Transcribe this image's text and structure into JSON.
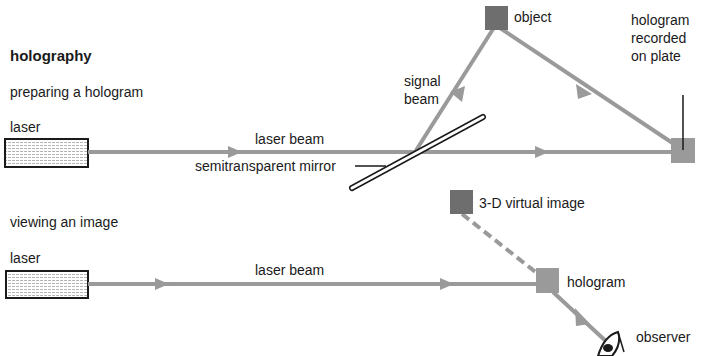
{
  "title": "holography",
  "sections": {
    "preparing": {
      "heading": "preparing a hologram",
      "laser_label": "laser",
      "beam_label": "laser beam",
      "mirror_label": "semitransparent mirror",
      "signal_beam_label": "signal\nbeam",
      "object_label": "object",
      "plate_label": "hologram\nrecorded\non plate"
    },
    "viewing": {
      "heading": "viewing an image",
      "laser_label": "laser",
      "beam_label": "laser beam",
      "virtual_image_label": "3-D virtual image",
      "hologram_label": "hologram",
      "observer_label": "observer"
    }
  },
  "colors": {
    "beam": "#9a9a9a",
    "object_fill": "#6e6e6e",
    "plate_fill": "#9a9a9a",
    "outline": "#1a1a1a"
  }
}
